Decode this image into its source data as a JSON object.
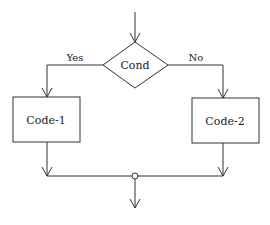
{
  "diagram": {
    "type": "flowchart",
    "decision": {
      "label": "Cond"
    },
    "branches": {
      "yes_label": "Yes",
      "no_label": "No"
    },
    "processes": [
      {
        "label": "Code-1"
      },
      {
        "label": "Code-2"
      }
    ],
    "colors": {
      "stroke": "#333333",
      "background": "#ffffff"
    }
  }
}
